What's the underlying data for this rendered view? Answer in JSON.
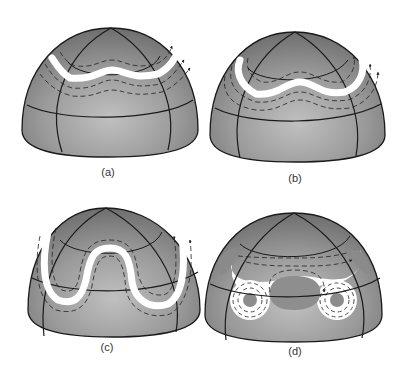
{
  "figure": {
    "colors": {
      "background": "#ffffff",
      "dome_light": "#c4c4c4",
      "dome_mid": "#9a9a9a",
      "dome_dark": "#707070",
      "grid_line": "#1a1a1a",
      "jet_core": "#ffffff",
      "arrow": "#222222"
    },
    "panels": [
      {
        "id": "a",
        "label": "(a)",
        "stage": "gentle wave in jet stream"
      },
      {
        "id": "b",
        "label": "(b)",
        "stage": "wave amplitude increasing"
      },
      {
        "id": "c",
        "label": "(c)",
        "stage": "large meanders / deep troughs"
      },
      {
        "id": "d",
        "label": "(d)",
        "stage": "cut-off cells (closed lows) separated from the jet"
      }
    ]
  }
}
